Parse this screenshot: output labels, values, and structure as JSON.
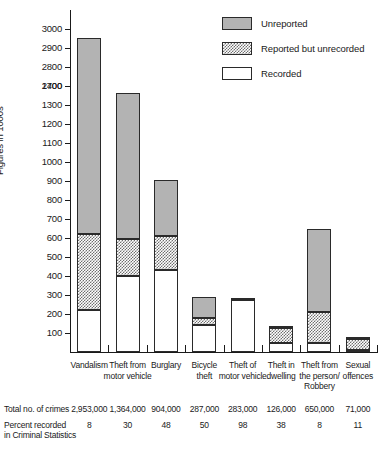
{
  "chart_data": {
    "type": "bar",
    "title": "",
    "subtitle": "",
    "xlabel": "",
    "ylabel": "Figures in 1000s",
    "grid": false,
    "legend_position": "top-right",
    "stacked": true,
    "axis_break": true,
    "y_tick_labels": [
      "3000",
      "2900",
      "2800",
      "2700",
      "1400",
      "1300",
      "1200",
      "1100",
      "1000",
      "900",
      "800",
      "700",
      "600",
      "500",
      "400",
      "300",
      "200",
      "100"
    ],
    "y_tick_values": [
      3000,
      2900,
      2800,
      2700,
      1400,
      1300,
      1200,
      1100,
      1000,
      900,
      800,
      700,
      600,
      500,
      400,
      300,
      200,
      100
    ],
    "ylim": [
      0,
      3000
    ],
    "categories": [
      "Vandalism",
      "Theft from motor vehicle",
      "Burglary",
      "Bicycle theft",
      "Theft of motor vehicle",
      "Theft in dwelling",
      "Theft from the person/ Robbery",
      "Sexual offences"
    ],
    "category_lines": [
      [
        "Vandalism"
      ],
      [
        "Theft from",
        "motor vehicle"
      ],
      [
        "Burglary"
      ],
      [
        "Bicycle",
        "theft"
      ],
      [
        "Theft of",
        "motor vehicle"
      ],
      [
        "Theft in",
        "dwelling"
      ],
      [
        "Theft from",
        "the person/",
        "Robbery"
      ],
      [
        "Sexual",
        "offences"
      ]
    ],
    "series": [
      {
        "name": "Recorded",
        "values": [
          220,
          400,
          430,
          140,
          275,
          45,
          50,
          10
        ]
      },
      {
        "name": "Reported but unrecorded",
        "values": [
          400,
          195,
          180,
          40,
          8,
          80,
          160,
          60
        ]
      },
      {
        "name": "Unreported",
        "values": [
          2333,
          769,
          294,
          107,
          0,
          1,
          440,
          1
        ]
      }
    ],
    "totals_label": "Total no. of crimes",
    "totals": [
      "2,953,000",
      "1,364,000",
      "904,000",
      "287,000",
      "283,000",
      "126,000",
      "650,000",
      "71,000"
    ],
    "percent_label_line1": "Percent recorded",
    "percent_label_line2": "in Criminal Statistics",
    "percent_recorded": [
      "8",
      "30",
      "48",
      "50",
      "98",
      "38",
      "8",
      "11"
    ],
    "colors": {
      "unreported": "#b3b3b3",
      "unrecorded": "#6f6f6f",
      "recorded": "#ffffff",
      "outline": "#2a2a2a",
      "text": "#1a1a1a"
    }
  },
  "legend": {
    "items": [
      {
        "label": "Unreported",
        "key": "unreported"
      },
      {
        "label": "Reported but unrecorded",
        "key": "unrecorded"
      },
      {
        "label": "Recorded",
        "key": "recorded"
      }
    ]
  }
}
